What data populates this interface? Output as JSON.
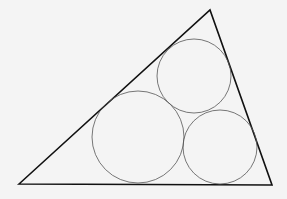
{
  "diagram": {
    "background": "#f4f4f4",
    "stroke_color": "#111111",
    "circle_color": "#555555",
    "triangle": {
      "points": [
        [
          19,
          184
        ],
        [
          210,
          10
        ],
        [
          272,
          185
        ]
      ]
    },
    "circles": [
      {
        "name": "large-circle",
        "cx": 138,
        "cy": 137,
        "r": 46
      },
      {
        "name": "upper-circle",
        "cx": 194,
        "cy": 76,
        "r": 37
      },
      {
        "name": "lower-right-circle",
        "cx": 220,
        "cy": 147,
        "r": 37
      }
    ]
  }
}
